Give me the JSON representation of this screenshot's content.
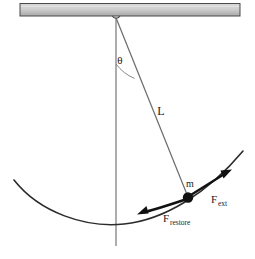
{
  "figure": {
    "type": "physics-diagram",
    "background_color": "#ffffff"
  },
  "labels": {
    "angle": "θ",
    "length": "L",
    "mass": "m",
    "force_external": "F",
    "force_external_sub": "ext",
    "force_restore": "F",
    "force_restore_sub": "restore"
  },
  "colors": {
    "ceiling_fill_light": "#d8d8d8",
    "ceiling_fill_dark": "#b0b0b0",
    "ceiling_stroke": "#555555",
    "line": "#5a5a5a",
    "arc_path": "#2b2b2b",
    "arrow": "#111111",
    "bob": "#111111",
    "text": "#1a1a1a"
  },
  "geometry": {
    "ceiling": {
      "x": 20,
      "y": 3,
      "width": 220,
      "height": 13
    },
    "pivot": {
      "x": 116,
      "y": 18
    },
    "bob": {
      "x": 188,
      "y": 197,
      "radius": 5
    },
    "vertical_line": {
      "x": 116,
      "y_top": 18,
      "y_bottom": 246
    },
    "angle_arc_radius": 46,
    "angle_degrees": 20
  },
  "elements": [
    "ceiling-bar",
    "pivot-ring",
    "vertical-reference-line",
    "pendulum-string",
    "angle-arc",
    "swing-path-arc",
    "pendulum-bob",
    "external-force-arrow",
    "restoring-force-arrow"
  ]
}
